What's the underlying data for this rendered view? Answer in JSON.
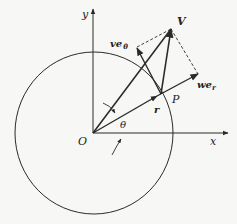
{
  "diagram": {
    "type": "polar-velocity-components",
    "colors": {
      "ink": "#2a2a2a",
      "background": "#f7f7f5"
    },
    "labels": {
      "y_axis": "y",
      "x_axis": "x",
      "origin": "O",
      "theta": "θ",
      "point": "P",
      "radius": "r",
      "velocity": "V",
      "radial_component": "we",
      "radial_subscript": "r",
      "transverse_component": "ve",
      "transverse_subscript": "θ"
    }
  }
}
